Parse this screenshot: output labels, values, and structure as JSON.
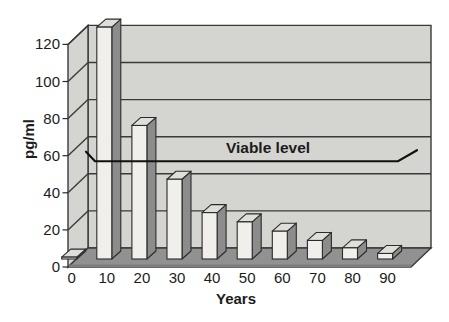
{
  "figure": {
    "background": "#ffffff"
  },
  "chart_data": {
    "type": "bar",
    "style": "3d-bar",
    "title": "",
    "xlabel": "Years",
    "ylabel": "pg/ml",
    "categories": [
      "0",
      "10",
      "20",
      "30",
      "40",
      "50",
      "60",
      "70",
      "80",
      "90"
    ],
    "values": [
      1,
      125,
      72,
      43,
      25,
      20,
      15,
      10,
      6,
      3
    ],
    "ylim": [
      0,
      120
    ],
    "yticks": [
      0,
      20,
      40,
      60,
      80,
      100,
      120
    ],
    "grid": true,
    "legend": false,
    "annotation": {
      "label": "Viable level",
      "value": 57
    },
    "colors": {
      "wall": "#d4d4d1",
      "grid_line": "#3a3a3a",
      "floor": "#919191",
      "floor_front": "#7e7e7e",
      "bar_front": "#f0efec",
      "bar_top": "#dededa",
      "bar_side": "#8c8c8c",
      "outline": "#2b2b2b",
      "text": "#1c1c1c",
      "annotation_line": "#111111"
    }
  }
}
